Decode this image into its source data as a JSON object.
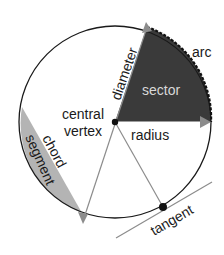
{
  "diagram": {
    "labels": {
      "arc": "arc",
      "sector": "sector",
      "diameter": "diameter",
      "central_vertex_line1": "central",
      "central_vertex_line2": "vertex",
      "radius": "radius",
      "chord": "chord",
      "segment": "segment",
      "tangent": "tangent"
    },
    "colors": {
      "circle": "#1a1a1a",
      "sector_fill": "#3a3a3a",
      "segment_fill": "#b4b4b4",
      "lines": "#8c8c8c",
      "points": "#111111"
    }
  }
}
